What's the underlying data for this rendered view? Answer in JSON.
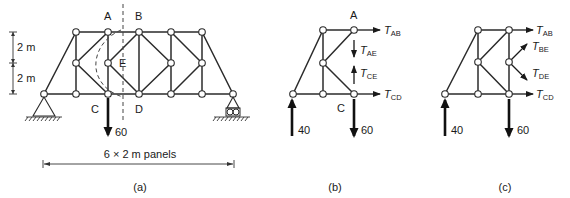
{
  "figure": {
    "panels": [
      {
        "id": "a",
        "caption": "(a)",
        "node_labels": {
          "A": "A",
          "B": "B",
          "C": "C",
          "D": "D",
          "E": "E"
        },
        "dimensions": {
          "vertical_upper": "2 m",
          "vertical_lower": "2 m",
          "span": "6 × 2 m panels"
        },
        "load": "60",
        "supports": [
          "pin-left",
          "roller-right"
        ]
      },
      {
        "id": "b",
        "caption": "(b)",
        "node_labels": {
          "A": "A",
          "C": "C"
        },
        "forces": {
          "T_AB": {
            "T": "T",
            "sub": "AB"
          },
          "T_AE": {
            "T": "T",
            "sub": "AE"
          },
          "T_CE": {
            "T": "T",
            "sub": "CE"
          },
          "T_CD": {
            "T": "T",
            "sub": "CD"
          }
        },
        "reaction": "40",
        "load": "60"
      },
      {
        "id": "c",
        "caption": "(c)",
        "forces": {
          "T_AB": {
            "T": "T",
            "sub": "AB"
          },
          "T_BE": {
            "T": "T",
            "sub": "BE"
          },
          "T_DE": {
            "T": "T",
            "sub": "DE"
          },
          "T_CD": {
            "T": "T",
            "sub": "CD"
          }
        },
        "reaction": "40",
        "load": "60"
      }
    ]
  }
}
